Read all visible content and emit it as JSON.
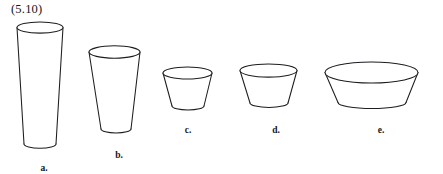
{
  "figure": {
    "reference_label": "(5.10)",
    "background_color": "#ffffff",
    "stroke_color": "#1b1d20",
    "width": 443,
    "height": 174,
    "caption_font_style": "serif"
  },
  "shapes": [
    {
      "key": "a",
      "label": "a.",
      "name": "tall-tapered-cup",
      "rim_center_x": 40,
      "rim_center_y": 27.5,
      "rim_rx": 23.0,
      "rim_ry": 5.6,
      "base_center_x": 40,
      "base_center_y": 144.0,
      "base_rx": 16.0,
      "base_ry": 4.2,
      "label_x": 44,
      "label_y": 164,
      "height_px": 117,
      "taper": "narrowing downward"
    },
    {
      "key": "b",
      "label": "b.",
      "name": "medium-tapered-cup",
      "rim_center_x": 114.5,
      "rim_center_y": 52.0,
      "rim_rx": 25.5,
      "rim_ry": 6.2,
      "base_center_x": 116,
      "base_center_y": 129.0,
      "base_rx": 15.0,
      "base_ry": 4.0,
      "label_x": 119,
      "label_y": 151,
      "height_px": 77,
      "taper": "narrowing downward"
    },
    {
      "key": "c",
      "label": "c.",
      "name": "small-bowl",
      "rim_center_x": 187.5,
      "rim_center_y": 73.0,
      "rim_rx": 24.5,
      "rim_ry": 6.0,
      "base_center_x": 188,
      "base_center_y": 106.0,
      "base_rx": 16.0,
      "base_ry": 4.0,
      "label_x": 188,
      "label_y": 126,
      "height_px": 33,
      "taper": "narrowing downward"
    },
    {
      "key": "d",
      "label": "d.",
      "name": "wide-shallow-bowl",
      "rim_center_x": 268.5,
      "rim_center_y": 70.5,
      "rim_rx": 28.5,
      "rim_ry": 6.6,
      "base_center_x": 269,
      "base_center_y": 103.0,
      "base_rx": 19.0,
      "base_ry": 4.4,
      "label_x": 276,
      "label_y": 126,
      "height_px": 33,
      "taper": "narrowing downward"
    },
    {
      "key": "e",
      "label": "e.",
      "name": "widest-shallowest-basin",
      "rim_center_x": 371.5,
      "rim_center_y": 72.5,
      "rim_rx": 46.5,
      "rim_ry": 10.5,
      "base_center_x": 372,
      "base_center_y": 102.5,
      "base_rx": 34.0,
      "base_ry": 6.0,
      "label_x": 381,
      "label_y": 126,
      "height_px": 30,
      "taper": "narrowing downward"
    }
  ]
}
